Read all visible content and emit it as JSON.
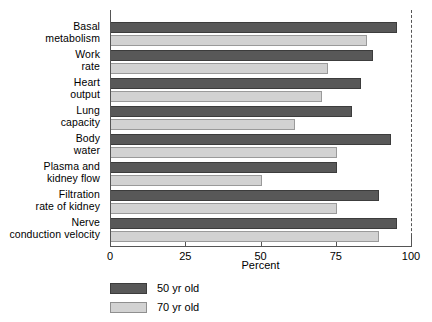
{
  "chart_data": {
    "type": "bar",
    "orientation": "horizontal",
    "title": "",
    "xlabel": "Percent",
    "ylabel": "",
    "xlim": [
      0,
      100
    ],
    "xticks": [
      0,
      25,
      50,
      75,
      100
    ],
    "xtick_labels": [
      "0",
      "25",
      "50",
      "75",
      "100"
    ],
    "grid": false,
    "reference_line": {
      "value": 100,
      "style": "dashed"
    },
    "legend_position": "bottom-left",
    "categories": [
      "Basal metabolism",
      "Work rate",
      "Heart output",
      "Lung capacity",
      "Body water",
      "Plasma and kidney flow",
      "Filtration rate of kidney",
      "Nerve conduction velocity"
    ],
    "category_lines": [
      [
        "Basal",
        "metabolism"
      ],
      [
        "Work",
        "rate"
      ],
      [
        "Heart",
        "output"
      ],
      [
        "Lung",
        "capacity"
      ],
      [
        "Body",
        "water"
      ],
      [
        "Plasma and",
        "kidney flow"
      ],
      [
        "Filtration",
        "rate of kidney"
      ],
      [
        "Nerve",
        "conduction velocity"
      ]
    ],
    "series": [
      {
        "name": "50 yr old",
        "color": "#585858",
        "values": [
          95,
          87,
          83,
          80,
          93,
          75,
          89,
          95
        ]
      },
      {
        "name": "70 yr old",
        "color": "#d2d2d2",
        "values": [
          85,
          72,
          70,
          61,
          75,
          50,
          75,
          89
        ]
      }
    ]
  },
  "legend": {
    "items": [
      {
        "label": "50 yr old",
        "color": "#585858"
      },
      {
        "label": "70 yr old",
        "color": "#d2d2d2"
      }
    ]
  }
}
